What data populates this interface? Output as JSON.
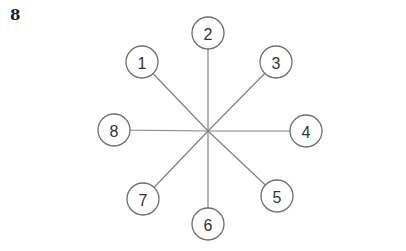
{
  "page": {
    "problem_number": "8",
    "background_color": "#ffffff"
  },
  "diagram": {
    "type": "hub-and-spoke star graph",
    "colors": {
      "line": "#828282",
      "circle_stroke": "#6f6f6f",
      "circle_fill": "#ffffff",
      "number_text": "#333333",
      "problem_label": "#1d1d1d"
    },
    "hub": {
      "x": 208,
      "y": 131
    },
    "node_radius": 16,
    "nodes": [
      {
        "label": "1",
        "position": "upper-left",
        "x": 142,
        "y": 62
      },
      {
        "label": "2",
        "position": "top",
        "x": 208,
        "y": 33
      },
      {
        "label": "3",
        "position": "upper-right",
        "x": 276,
        "y": 62
      },
      {
        "label": "4",
        "position": "right",
        "x": 306,
        "y": 131
      },
      {
        "label": "5",
        "position": "lower-right",
        "x": 277,
        "y": 196
      },
      {
        "label": "6",
        "position": "bottom",
        "x": 208,
        "y": 224
      },
      {
        "label": "7",
        "position": "lower-left",
        "x": 143,
        "y": 199
      },
      {
        "label": "8",
        "position": "left",
        "x": 114,
        "y": 130
      }
    ]
  }
}
